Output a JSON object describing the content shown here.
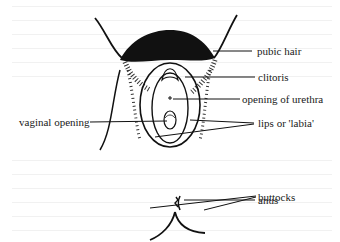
{
  "figure": {
    "labels": {
      "pubic_hair": "pubic hair",
      "clitoris": "clitoris",
      "urethra": "opening of urethra",
      "labia": "lips or 'labia'",
      "vaginal_opening": "vaginal opening",
      "anus": "anus",
      "buttocks": "buttocks"
    }
  }
}
